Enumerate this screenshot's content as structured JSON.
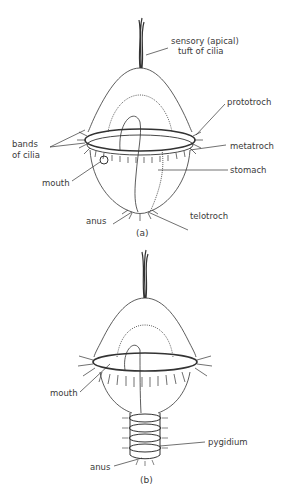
{
  "figure_a": {
    "caption": "(a)",
    "labels": {
      "apical_tuft_line1": "sensory (apical)",
      "apical_tuft_line2": "tuft of cilia",
      "prototroch": "prototroch",
      "bands_line1": "bands",
      "bands_line2": "of cilia",
      "metatroch": "metatroch",
      "stomach": "stomach",
      "mouth": "mouth",
      "anus": "anus",
      "telotroch": "telotroch"
    }
  },
  "figure_b": {
    "caption": "(b)",
    "labels": {
      "mouth": "mouth",
      "pygidium": "pygidium",
      "anus": "anus"
    }
  },
  "colors": {
    "ink": "#333333",
    "background": "#ffffff"
  }
}
